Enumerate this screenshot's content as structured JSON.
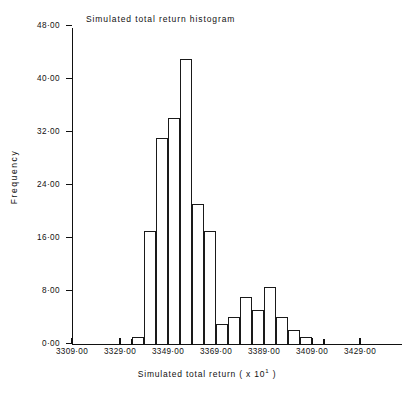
{
  "chart_data": {
    "type": "bar",
    "title": "Simulated total  return histogram",
    "xlabel": "Simulated total  return ( x 10¹ )",
    "ylabel": "Frequency",
    "grid": false,
    "legend": "none",
    "xlim": [
      3309.0,
      3434.0
    ],
    "ylim": [
      0.0,
      48.0
    ],
    "bin_width": 5,
    "xtick_labels": [
      "3309·00",
      "3329·00",
      "3349·00",
      "3369·00",
      "3389·00",
      "3409·00",
      "3429·00"
    ],
    "xtick_values": [
      3309,
      3329,
      3349,
      3369,
      3389,
      3409,
      3429
    ],
    "ytick_labels": [
      "0·00",
      "8·00",
      "16·00",
      "24·00",
      "32·00",
      "40·00",
      "48·00"
    ],
    "ytick_values": [
      0,
      8,
      16,
      24,
      32,
      40,
      48
    ],
    "bin_starts": [
      3334,
      3339,
      3344,
      3349,
      3354,
      3359,
      3364,
      3369,
      3374,
      3379,
      3384,
      3389,
      3394,
      3399,
      3404
    ],
    "categories": [
      "3334",
      "3339",
      "3344",
      "3349",
      "3354",
      "3359",
      "3364",
      "3369",
      "3374",
      "3379",
      "3384",
      "3389",
      "3394",
      "3399",
      "3404"
    ],
    "values": [
      1,
      17,
      31,
      34,
      43,
      21,
      17,
      3,
      4,
      7,
      5,
      8.5,
      4,
      2,
      1
    ]
  },
  "figure": {
    "title": "Simulated total  return histogram",
    "x_axis_title": "Simulated total  return ( x 10",
    "x_axis_title_exponent": "1",
    "x_axis_title_tail": " )",
    "y_axis_title": "Frequency"
  }
}
